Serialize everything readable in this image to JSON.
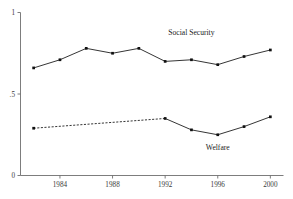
{
  "chart_data": {
    "type": "line",
    "title": "",
    "xlabel": "",
    "ylabel": "",
    "xlim": [
      1981,
      2001
    ],
    "ylim": [
      0,
      1
    ],
    "grid": false,
    "legend_position": "inline-annotation",
    "x_tick_labels": [
      "1984",
      "1988",
      "1992",
      "1996",
      "2000"
    ],
    "x_tick_values": [
      1984,
      1988,
      1992,
      1996,
      2000
    ],
    "y_tick_labels": [
      "1",
      ".5",
      "0"
    ],
    "y_tick_values": [
      1,
      0.5,
      0
    ],
    "x": [
      1982,
      1984,
      1986,
      1988,
      1990,
      1992,
      1994,
      1996,
      1998,
      2000
    ],
    "series": [
      {
        "name": "Social Security",
        "style": "solid",
        "markers": true,
        "values": [
          0.66,
          0.71,
          0.78,
          0.75,
          0.78,
          0.7,
          0.71,
          0.68,
          0.73,
          0.77
        ],
        "label_x": 1994,
        "label_y": 0.86
      },
      {
        "name": "Welfare",
        "style": "dashed-then-solid",
        "markers": true,
        "values": [
          0.29,
          null,
          null,
          null,
          null,
          0.35,
          0.28,
          0.25,
          0.3,
          0.36
        ],
        "dashed_segment": {
          "from_x": 1982,
          "from_y": 0.29,
          "to_x": 1992,
          "to_y": 0.35
        },
        "solid_x": [
          1992,
          1994,
          1996,
          1998,
          2000
        ],
        "solid_values": [
          0.35,
          0.28,
          0.25,
          0.3,
          0.36
        ],
        "marker_x": [
          1982,
          1992,
          1994,
          1996,
          1998,
          2000
        ],
        "marker_values": [
          0.29,
          0.35,
          0.28,
          0.25,
          0.3,
          0.36
        ],
        "label_x": 1996,
        "label_y": 0.155
      }
    ],
    "colors": {
      "line": "#111111",
      "axis": "#6e6e6e",
      "text": "#1a1a1a",
      "background": "#ffffff"
    }
  }
}
